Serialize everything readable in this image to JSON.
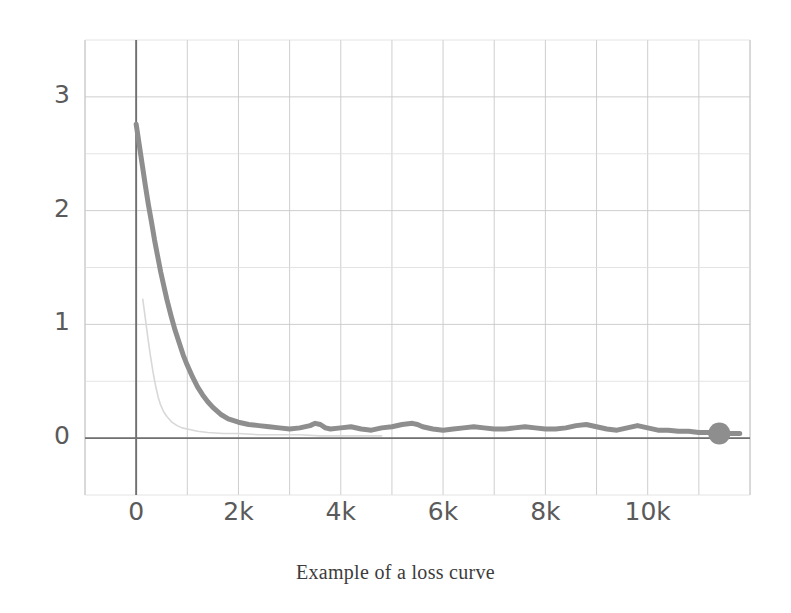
{
  "figure": {
    "caption": "Example of a loss curve",
    "background_color": "#ffffff"
  },
  "chart_data": {
    "type": "line",
    "title": "",
    "subtitle": "",
    "caption": "Example of a loss curve",
    "xlabel": "",
    "ylabel": "",
    "xlim": [
      -1000,
      12000
    ],
    "ylim": [
      -0.5,
      3.5
    ],
    "xticks": [
      0,
      2000,
      4000,
      6000,
      8000,
      10000
    ],
    "xticklabels": [
      "0",
      "2k",
      "4k",
      "6k",
      "8k",
      "10k"
    ],
    "yticks": [
      0,
      1,
      2,
      3
    ],
    "yticklabels": [
      "0",
      "1",
      "2",
      "3"
    ],
    "minor_yticks": [
      -0.5,
      0.5,
      1.5,
      2.5,
      3.5
    ],
    "grid": true,
    "grid_color": "#c8c8c8",
    "axis_color": "#707070",
    "legend": "none",
    "series": [
      {
        "name": "loss",
        "color": "#8e8e8e",
        "linewidth": 5,
        "marker": "circle-end",
        "marker_x": 11400,
        "marker_y": 0.04,
        "x": [
          0,
          60,
          120,
          180,
          240,
          300,
          360,
          420,
          480,
          540,
          600,
          680,
          760,
          840,
          920,
          1000,
          1100,
          1200,
          1300,
          1400,
          1500,
          1650,
          1800,
          2000,
          2200,
          2400,
          2600,
          2800,
          3000,
          3200,
          3400,
          3500,
          3600,
          3700,
          3800,
          4000,
          4200,
          4400,
          4600,
          4800,
          5000,
          5200,
          5400,
          5500,
          5600,
          5800,
          6000,
          6200,
          6400,
          6600,
          6800,
          7000,
          7200,
          7400,
          7600,
          7800,
          8000,
          8200,
          8400,
          8600,
          8800,
          9000,
          9200,
          9400,
          9600,
          9800,
          10000,
          10200,
          10400,
          10600,
          10800,
          11000,
          11200,
          11400,
          11800
        ],
        "y": [
          2.76,
          2.58,
          2.4,
          2.22,
          2.05,
          1.9,
          1.74,
          1.6,
          1.46,
          1.34,
          1.22,
          1.08,
          0.95,
          0.84,
          0.73,
          0.64,
          0.54,
          0.45,
          0.38,
          0.32,
          0.27,
          0.21,
          0.17,
          0.14,
          0.12,
          0.11,
          0.1,
          0.09,
          0.08,
          0.09,
          0.11,
          0.13,
          0.12,
          0.09,
          0.08,
          0.09,
          0.1,
          0.08,
          0.07,
          0.09,
          0.1,
          0.12,
          0.13,
          0.12,
          0.1,
          0.08,
          0.07,
          0.08,
          0.09,
          0.1,
          0.09,
          0.08,
          0.08,
          0.09,
          0.1,
          0.09,
          0.08,
          0.08,
          0.09,
          0.11,
          0.12,
          0.1,
          0.08,
          0.07,
          0.09,
          0.11,
          0.09,
          0.07,
          0.07,
          0.06,
          0.06,
          0.05,
          0.05,
          0.04,
          0.04
        ]
      },
      {
        "name": "loss-faded",
        "color": "#d8d8d8",
        "linewidth": 1.6,
        "marker": "none",
        "x": [
          130,
          180,
          230,
          280,
          330,
          380,
          430,
          480,
          540,
          600,
          700,
          800,
          900,
          1000,
          1200,
          1400,
          1700,
          2000,
          2400,
          2800,
          3200,
          3600,
          4000,
          4400,
          4800
        ],
        "y": [
          1.22,
          1.05,
          0.88,
          0.72,
          0.58,
          0.46,
          0.36,
          0.29,
          0.23,
          0.19,
          0.14,
          0.11,
          0.09,
          0.08,
          0.06,
          0.05,
          0.04,
          0.04,
          0.03,
          0.03,
          0.03,
          0.02,
          0.02,
          0.02,
          0.02
        ]
      }
    ]
  },
  "axes": {
    "y_tick_labels": [
      {
        "text": "3",
        "value": 3
      },
      {
        "text": "2",
        "value": 2
      },
      {
        "text": "1",
        "value": 1
      },
      {
        "text": "0",
        "value": 0
      }
    ],
    "x_tick_labels": [
      {
        "text": "0",
        "value": 0
      },
      {
        "text": "2k",
        "value": 2000
      },
      {
        "text": "4k",
        "value": 4000
      },
      {
        "text": "6k",
        "value": 6000
      },
      {
        "text": "8k",
        "value": 8000
      },
      {
        "text": "10k",
        "value": 10000
      }
    ]
  }
}
